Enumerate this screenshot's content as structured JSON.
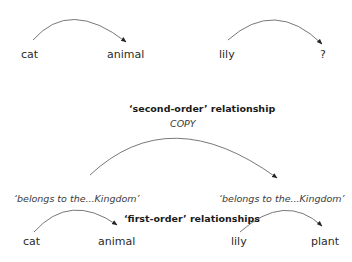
{
  "top_analogy": {
    "left": {
      "source": "cat",
      "target": "animal"
    },
    "right": {
      "source": "lily",
      "target": "?"
    }
  },
  "second_order": {
    "heading": "‘second-order’ relationship",
    "arrow_label": "COPY"
  },
  "first_order": {
    "heading": "‘first-order’ relationships",
    "left": {
      "relation": "‘belongs to the...Kingdom’",
      "source": "cat",
      "target": "animal"
    },
    "right": {
      "relation": "‘belongs to the...Kingdom’",
      "source": "lily",
      "target": "plant"
    }
  },
  "colors": {
    "text": "#2a2a2a",
    "arrow": "#555555"
  }
}
